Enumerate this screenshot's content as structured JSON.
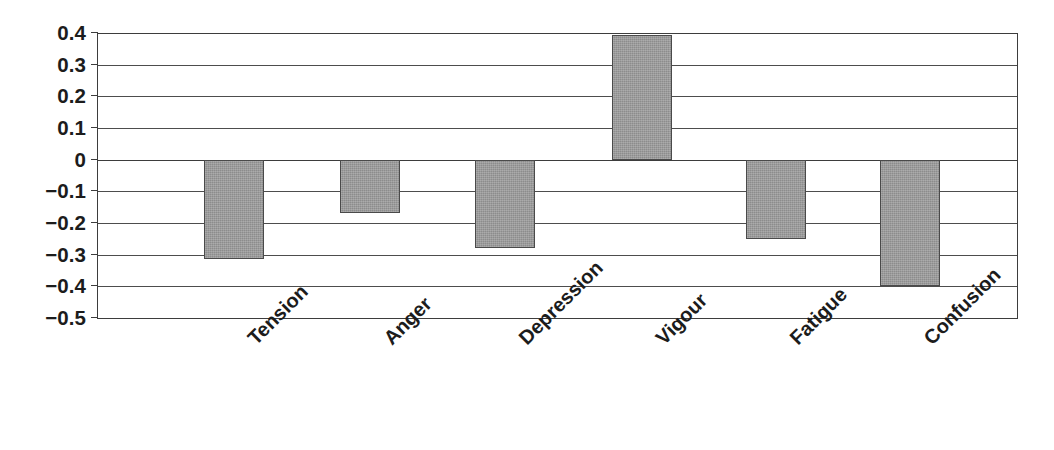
{
  "chart_data": {
    "type": "bar",
    "title": "",
    "subtitle": "",
    "xlabel": "",
    "ylabel": "",
    "categories": [
      "Tension",
      "Anger",
      "Depression",
      "Vigour",
      "Fatigue",
      "Confusion"
    ],
    "values": [
      -0.315,
      -0.17,
      -0.28,
      0.395,
      -0.25,
      -0.4
    ],
    "series": [
      {
        "name": "",
        "values": [
          -0.315,
          -0.17,
          -0.28,
          0.395,
          -0.25,
          -0.4
        ]
      }
    ],
    "ylim": [
      -0.5,
      0.4
    ],
    "ytick_step": 0.1,
    "ytick_labels": [
      "0.4",
      "0.3",
      "0.2",
      "0.1",
      "0",
      "−0.1",
      "−0.2",
      "−0.3",
      "−0.4",
      "−0.5"
    ],
    "ytick_values": [
      0.4,
      0.3,
      0.2,
      0.1,
      0,
      -0.1,
      -0.2,
      -0.3,
      -0.4,
      -0.5
    ],
    "grid": true,
    "grid_axis": "y",
    "legend": false,
    "legend_position": "none",
    "annotations": [],
    "bar_color": "#8c8c8c",
    "bar_edge_color": "#4a4a4a",
    "axis_color": "#3d3d3d",
    "grid_color": "#4d4d4d",
    "text_color": "#1c1c1c",
    "background_color": "#ffffff",
    "xtick_label_rotation": -45
  },
  "layout": {
    "plot_left": 97,
    "plot_right": 1018,
    "plot_top": 33,
    "plot_bottom": 318,
    "bar_width": 60,
    "bar_centers": [
      234,
      370,
      505,
      642,
      776,
      910
    ]
  }
}
